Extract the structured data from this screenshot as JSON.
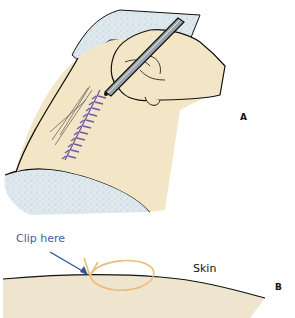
{
  "figure": {
    "panel_a": {
      "letter": "A",
      "description": "Hand holding forceps removing staples/clips from a sutured wound on skin"
    },
    "panel_b": {
      "letter": "B",
      "clip_label": "Clip here",
      "skin_label": "Skin"
    }
  },
  "colors": {
    "skin": "#f3e6c6",
    "drape": "#dde9ee",
    "suture": "#6a5aa8",
    "arrow": "#2f5597",
    "loop": "#e7bd7a",
    "outline": "#111111"
  }
}
